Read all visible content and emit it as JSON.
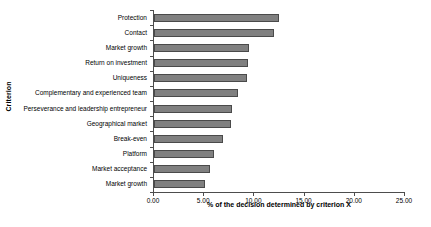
{
  "chart_data": {
    "type": "bar",
    "orientation": "horizontal",
    "title": "",
    "xlabel": "% of the decision determined by criterion X",
    "ylabel": "Criterion",
    "xlim": [
      0.0,
      25.0
    ],
    "xticks": [
      "0.00",
      "5.00",
      "10.00",
      "15.00",
      "20.00",
      "25.00"
    ],
    "xtick_values": [
      0,
      5,
      10,
      15,
      20,
      25
    ],
    "grid": false,
    "legend": false,
    "bar_color": "#808080",
    "bar_edge_color": "#4a4a4a",
    "categories": [
      "Protection",
      "Contact",
      "Market growth",
      "Return on investment",
      "Uniqueness",
      "Complementary and experienced team",
      "Perseverance and leadership entrepreneur",
      "Geographical market",
      "Break-even",
      "Platform",
      "Market acceptance",
      "Market growth"
    ],
    "values": [
      12.45,
      12.0,
      9.5,
      9.35,
      9.3,
      8.4,
      7.75,
      7.65,
      6.85,
      6.0,
      5.6,
      5.1
    ]
  }
}
